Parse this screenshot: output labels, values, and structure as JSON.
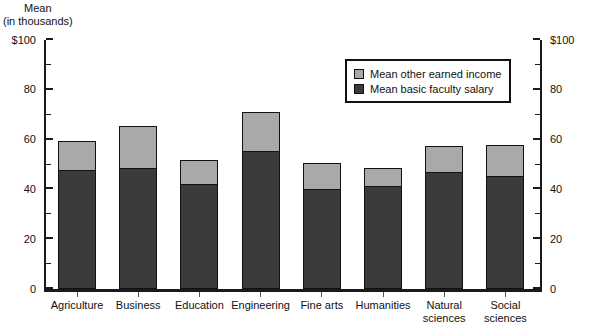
{
  "chart_data": {
    "type": "bar",
    "title": "",
    "subtitle": "",
    "xlabel": "",
    "ylabel": "Mean\n(in thousands)",
    "ylabel_lines": [
      "Mean",
      "(in thousands)"
    ],
    "ylim": [
      0,
      100
    ],
    "grid": false,
    "stacked": true,
    "legend_position": "upper-center-right",
    "y_ticks": [
      0,
      20,
      40,
      60,
      80,
      100
    ],
    "y_tick_labels": [
      "0",
      "20",
      "40",
      "60",
      "80",
      "$100"
    ],
    "y_minor_ticks": [
      10,
      30,
      50,
      70,
      90
    ],
    "right_axis_tick_labels": [
      "0",
      "20",
      "40",
      "60",
      "80",
      "$100"
    ],
    "categories": [
      "Agriculture",
      "Business",
      "Education",
      "Engineering",
      "Fine arts",
      "Humanities",
      "Natural\nsciences",
      "Social\nsciences"
    ],
    "series": [
      {
        "name": "Mean basic faculty salary",
        "color": "#3b3b3b",
        "values": [
          48,
          49,
          42.5,
          55.5,
          40.5,
          41.5,
          47,
          45.5
        ]
      },
      {
        "name": "Mean other earned income",
        "color": "#a9a9a9",
        "values": [
          11.5,
          16.5,
          9.5,
          15.5,
          10,
          7,
          10.5,
          12.5
        ]
      }
    ],
    "totals": [
      59.5,
      65.5,
      52,
      71,
      50.5,
      48.5,
      57.5,
      58
    ]
  },
  "legend": {
    "items": [
      {
        "label": "Mean other earned income",
        "color": "#a9a9a9"
      },
      {
        "label": "Mean basic faculty salary",
        "color": "#3b3b3b"
      }
    ]
  },
  "colors": {
    "upper_segment": "#a9a9a9",
    "lower_segment": "#3b3b3b",
    "axis": "#1a1a1a",
    "background": "#ffffff"
  }
}
